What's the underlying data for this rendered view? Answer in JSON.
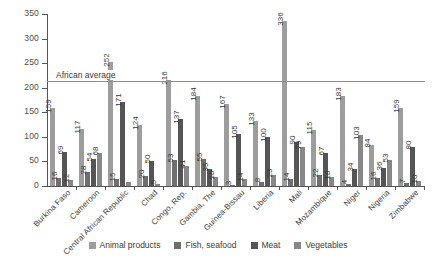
{
  "chart_data": {
    "type": "bar",
    "title": "",
    "xlabel": "",
    "ylabel": "",
    "ylim": [
      0,
      350
    ],
    "ytick_step": 50,
    "yticks": [
      "0",
      "50",
      "100",
      "150",
      "200",
      "250",
      "300",
      "350"
    ],
    "grid": false,
    "legend_position": "bottom",
    "categories": [
      "Burkina Faso",
      "Cameroon",
      "Central African Republic",
      "Chad",
      "Congo, Rep.",
      "Gambia, The",
      "Guinea-Bissau",
      "Liberia",
      "Mali",
      "Mozambique",
      "Niger",
      "Nigeria",
      "Zimbabwe"
    ],
    "series": [
      {
        "name": "Animal products",
        "color": "#9d9d9d",
        "values": [
          159,
          117,
          252,
          124,
          216,
          184,
          167,
          133,
          336,
          115,
          183,
          84,
          159
        ],
        "labels": [
          "159",
          "117",
          "252",
          "124",
          "216",
          "184",
          "167",
          "133",
          "336",
          "115",
          "183",
          "84",
          "159"
        ]
      },
      {
        "name": "Fish, seafood",
        "color": "#6f6f6f",
        "values": [
          16,
          28,
          15,
          20,
          53,
          55,
          3,
          8,
          14,
          22,
          4,
          16,
          7
        ],
        "labels": [
          "16",
          "28",
          "15",
          "20",
          "53",
          "55",
          "3",
          "8",
          "14",
          "22",
          "4",
          "16",
          "7"
        ]
      },
      {
        "name": "Meat",
        "color": "#555555",
        "values": [
          69,
          54,
          171,
          50,
          137,
          35,
          105,
          100,
          90,
          67,
          34,
          36,
          80
        ],
        "labels": [
          "69",
          "54",
          "171",
          "50",
          "137",
          "35",
          "105",
          "100",
          "90",
          "67",
          "34",
          "36",
          "80"
        ]
      },
      {
        "name": "Vegetables",
        "color": "#878787",
        "values": [
          12,
          68,
          8,
          5,
          41,
          18,
          14,
          23,
          79,
          18,
          103,
          53,
          10
        ],
        "labels": [
          "12",
          "68",
          "",
          "5",
          "41",
          "18",
          "14",
          "23",
          "79",
          "18",
          "103",
          "53",
          "10"
        ]
      }
    ],
    "reference_line": {
      "label": "African average",
      "value": 214,
      "color": "#8d8d8d"
    }
  }
}
